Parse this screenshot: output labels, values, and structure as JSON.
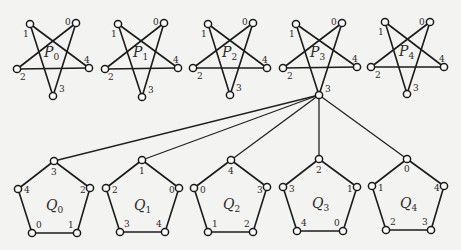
{
  "diagram": {
    "colors": {
      "line": "#1c1c1c",
      "vertex_fill": "#fbfbfa",
      "background": "#f3f3f1"
    },
    "stars": [
      {
        "name": "P",
        "sub": "0",
        "center": [
          52,
          52
        ],
        "vertices": [
          {
            "id": "0",
            "pos": [
              76,
              23
            ],
            "label_pos": [
              65,
              25
            ]
          },
          {
            "id": "1",
            "pos": [
              30,
              24
            ],
            "label_pos": [
              23,
              37
            ]
          },
          {
            "id": "2",
            "pos": [
              17,
              69
            ],
            "label_pos": [
              20,
              80
            ]
          },
          {
            "id": "3",
            "pos": [
              53,
              96
            ],
            "label_pos": [
              59,
              92
            ]
          },
          {
            "id": "4",
            "pos": [
              89,
              68
            ],
            "label_pos": [
              84,
              63
            ]
          }
        ]
      },
      {
        "name": "P",
        "sub": "1",
        "center": [
          141,
          52
        ],
        "vertices": [
          {
            "id": "0",
            "pos": [
              164,
              23
            ],
            "label_pos": [
              153,
              25
            ]
          },
          {
            "id": "1",
            "pos": [
              118,
              24
            ],
            "label_pos": [
              111,
              37
            ]
          },
          {
            "id": "2",
            "pos": [
              105,
              69
            ],
            "label_pos": [
              108,
              80
            ]
          },
          {
            "id": "3",
            "pos": [
              142,
              97
            ],
            "label_pos": [
              148,
              93
            ]
          },
          {
            "id": "4",
            "pos": [
              178,
              68
            ],
            "label_pos": [
              173,
              63
            ]
          }
        ]
      },
      {
        "name": "P",
        "sub": "2",
        "center": [
          230,
          52
        ],
        "vertices": [
          {
            "id": "0",
            "pos": [
              253,
              23
            ],
            "label_pos": [
              242,
              25
            ]
          },
          {
            "id": "1",
            "pos": [
              208,
              24
            ],
            "label_pos": [
              201,
              37
            ]
          },
          {
            "id": "2",
            "pos": [
              193,
              68
            ],
            "label_pos": [
              197,
              79
            ]
          },
          {
            "id": "3",
            "pos": [
              230,
              95
            ],
            "label_pos": [
              236,
              91
            ]
          },
          {
            "id": "4",
            "pos": [
              267,
              68
            ],
            "label_pos": [
              262,
              63
            ]
          }
        ]
      },
      {
        "name": "P",
        "sub": "3",
        "center": [
          318,
          52
        ],
        "vertices": [
          {
            "id": "0",
            "pos": [
              342,
              23
            ],
            "label_pos": [
              331,
              25
            ]
          },
          {
            "id": "1",
            "pos": [
              296,
              24
            ],
            "label_pos": [
              289,
              37
            ]
          },
          {
            "id": "2",
            "pos": [
              283,
              68
            ],
            "label_pos": [
              287,
              79
            ]
          },
          {
            "id": "3",
            "pos": [
              319,
              95
            ],
            "label_pos": [
              325,
              92
            ]
          },
          {
            "id": "4",
            "pos": [
              357,
              67
            ],
            "label_pos": [
              352,
              62
            ]
          }
        ]
      },
      {
        "name": "P",
        "sub": "4",
        "center": [
          407,
          51
        ],
        "vertices": [
          {
            "id": "0",
            "pos": [
              430,
              22
            ],
            "label_pos": [
              419,
              25
            ]
          },
          {
            "id": "1",
            "pos": [
              385,
              22
            ],
            "label_pos": [
              378,
              35
            ]
          },
          {
            "id": "2",
            "pos": [
              371,
              67
            ],
            "label_pos": [
              375,
              78
            ]
          },
          {
            "id": "3",
            "pos": [
              407,
              94
            ],
            "label_pos": [
              413,
              91
            ]
          },
          {
            "id": "4",
            "pos": [
              444,
              67
            ],
            "label_pos": [
              439,
              62
            ]
          }
        ]
      }
    ],
    "pentagons": [
      {
        "name": "Q",
        "sub": "0",
        "center": [
          54,
          205
        ],
        "vertices": [
          {
            "id": "3",
            "pos": [
              54,
              161
            ],
            "label_pos": [
              51,
              175
            ]
          },
          {
            "id": "2",
            "pos": [
              90,
              188
            ],
            "label_pos": [
              80,
              193
            ]
          },
          {
            "id": "1",
            "pos": [
              77,
              233
            ],
            "label_pos": [
              68,
              228
            ]
          },
          {
            "id": "0",
            "pos": [
              32,
              233
            ],
            "label_pos": [
              36,
              228
            ]
          },
          {
            "id": "4",
            "pos": [
              18,
              189
            ],
            "label_pos": [
              24,
              193
            ]
          }
        ]
      },
      {
        "name": "Q",
        "sub": "1",
        "center": [
          142,
          205
        ],
        "vertices": [
          {
            "id": "1",
            "pos": [
              142,
              160
            ],
            "label_pos": [
              139,
              174
            ]
          },
          {
            "id": "0",
            "pos": [
              179,
              188
            ],
            "label_pos": [
              169,
              193
            ]
          },
          {
            "id": "4",
            "pos": [
              165,
              232
            ],
            "label_pos": [
              156,
              227
            ]
          },
          {
            "id": "3",
            "pos": [
              120,
              232
            ],
            "label_pos": [
              124,
              227
            ]
          },
          {
            "id": "2",
            "pos": [
              106,
              188
            ],
            "label_pos": [
              112,
              193
            ]
          }
        ]
      },
      {
        "name": "Q",
        "sub": "2",
        "center": [
          231,
          204
        ],
        "vertices": [
          {
            "id": "4",
            "pos": [
              231,
              160
            ],
            "label_pos": [
              228,
              174
            ]
          },
          {
            "id": "3",
            "pos": [
              267,
              187
            ],
            "label_pos": [
              257,
              193
            ]
          },
          {
            "id": "2",
            "pos": [
              253,
              232
            ],
            "label_pos": [
              244,
              227
            ]
          },
          {
            "id": "1",
            "pos": [
              208,
              232
            ],
            "label_pos": [
              212,
              227
            ]
          },
          {
            "id": "0",
            "pos": [
              194,
              188
            ],
            "label_pos": [
              200,
              193
            ]
          }
        ]
      },
      {
        "name": "Q",
        "sub": "3",
        "center": [
          320,
          203
        ],
        "vertices": [
          {
            "id": "2",
            "pos": [
              319,
              159
            ],
            "label_pos": [
              316,
              173
            ]
          },
          {
            "id": "1",
            "pos": [
              357,
              187
            ],
            "label_pos": [
              347,
              192
            ]
          },
          {
            "id": "0",
            "pos": [
              343,
              231
            ],
            "label_pos": [
              334,
              226
            ]
          },
          {
            "id": "4",
            "pos": [
              297,
              231
            ],
            "label_pos": [
              301,
              226
            ]
          },
          {
            "id": "3",
            "pos": [
              283,
              187
            ],
            "label_pos": [
              289,
              192
            ]
          }
        ]
      },
      {
        "name": "Q",
        "sub": "4",
        "center": [
          408,
          203
        ],
        "vertices": [
          {
            "id": "0",
            "pos": [
              407,
              159
            ],
            "label_pos": [
              404,
              172
            ]
          },
          {
            "id": "4",
            "pos": [
              444,
              186
            ],
            "label_pos": [
              434,
              191
            ]
          },
          {
            "id": "3",
            "pos": [
              431,
              230
            ],
            "label_pos": [
              422,
              225
            ]
          },
          {
            "id": "2",
            "pos": [
              386,
              230
            ],
            "label_pos": [
              390,
              225
            ]
          },
          {
            "id": "1",
            "pos": [
              372,
              186
            ],
            "label_pos": [
              378,
              191
            ]
          }
        ]
      }
    ],
    "hub": {
      "star": "P3",
      "vertex": "3",
      "pos": [
        319,
        95
      ]
    },
    "hub_links": [
      {
        "to": "Q0.3",
        "pos": [
          54,
          161
        ]
      },
      {
        "to": "Q1.1",
        "pos": [
          142,
          160
        ]
      },
      {
        "to": "Q2.4",
        "pos": [
          231,
          160
        ]
      },
      {
        "to": "Q3.2",
        "pos": [
          319,
          159
        ]
      },
      {
        "to": "Q4.0",
        "pos": [
          407,
          159
        ]
      }
    ]
  }
}
